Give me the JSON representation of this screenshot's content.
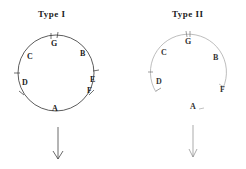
{
  "diagrams": [
    {
      "title": "Type I",
      "labels": {
        "G": "G",
        "B": "B",
        "C": "C",
        "D": "D",
        "E": "E",
        "F": "F",
        "A": "A"
      }
    },
    {
      "title": "Type II",
      "labels": {
        "G": "G",
        "B": "B",
        "C": "C",
        "D": "D",
        "F": "F",
        "A": "A"
      }
    }
  ],
  "colors": {
    "line": "#333333",
    "faint_line": "#9a9a9a",
    "background": "#ffffff"
  }
}
